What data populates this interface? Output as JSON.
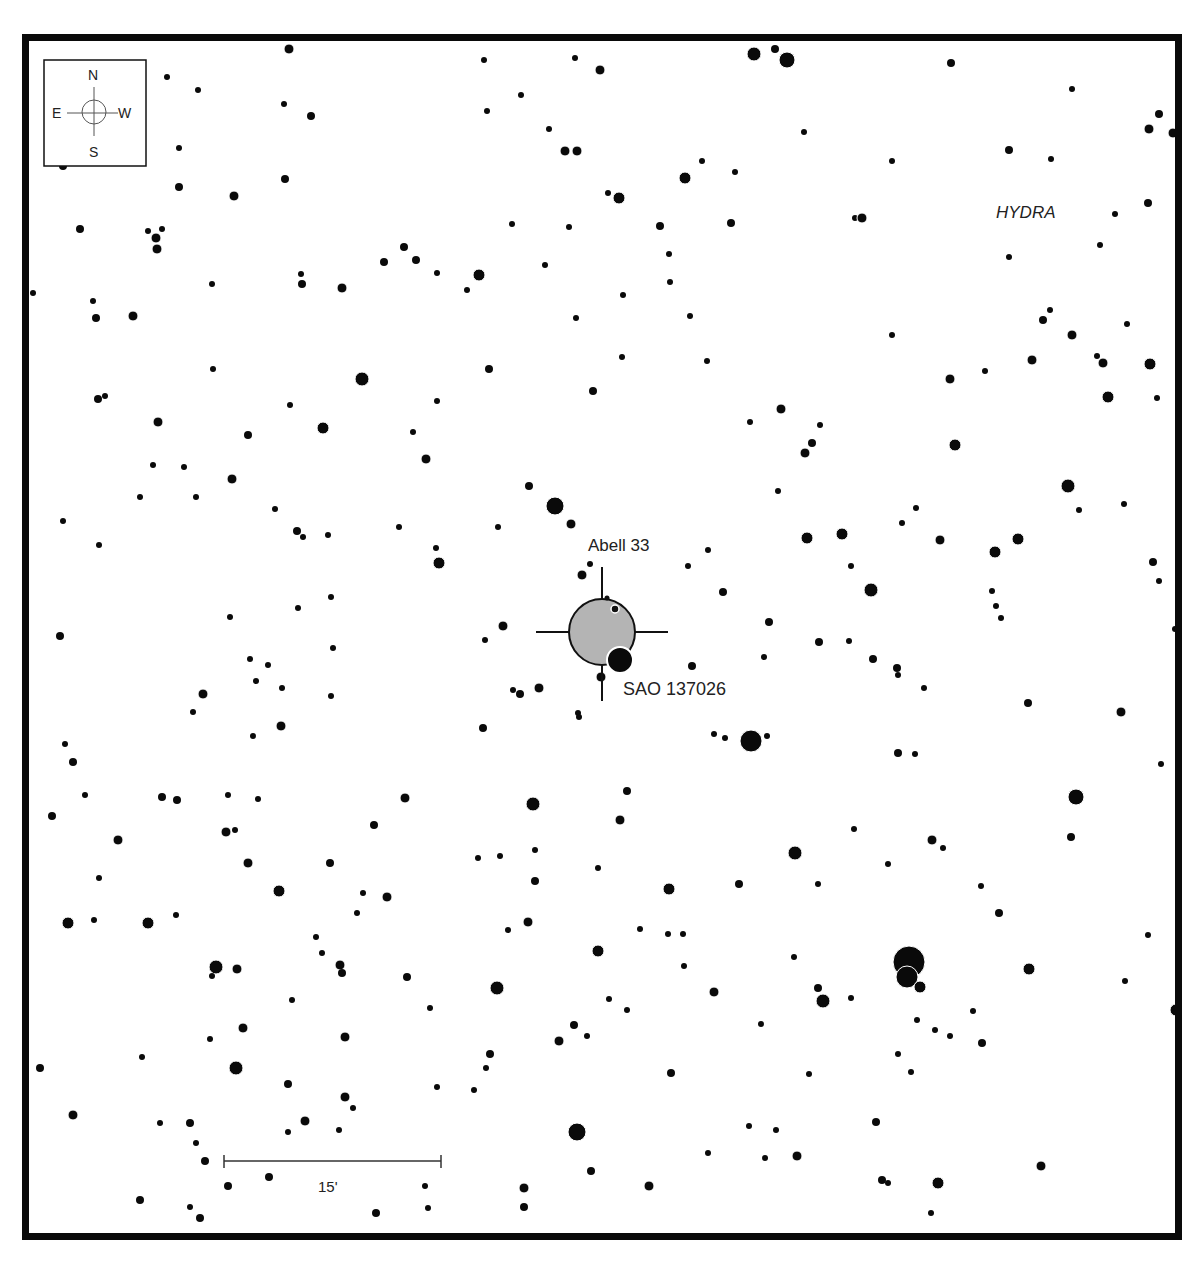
{
  "chart": {
    "constellation_label": "HYDRA",
    "target": {
      "name": "Abell 33",
      "x": 602,
      "y": 632,
      "r": 33,
      "fill": "#b4b4b4"
    },
    "nearby_star_label": {
      "name": "SAO 137026",
      "x": 620,
      "y": 660,
      "r": 13
    },
    "compass": {
      "north": "N",
      "south": "S",
      "east": "E",
      "west": "W"
    },
    "scale_bar": {
      "label": "15'",
      "x1": 224,
      "x2": 441,
      "y": 1161
    }
  },
  "stars": [
    [
      289,
      49,
      5
    ],
    [
      575,
      58,
      3
    ],
    [
      600,
      70,
      5
    ],
    [
      754,
      54,
      7
    ],
    [
      775,
      49,
      4
    ],
    [
      787,
      60,
      8
    ],
    [
      951,
      63,
      4
    ],
    [
      484,
      60,
      3
    ],
    [
      167,
      77,
      3
    ],
    [
      198,
      90,
      3
    ],
    [
      284,
      104,
      3
    ],
    [
      311,
      116,
      4
    ],
    [
      487,
      111,
      3
    ],
    [
      521,
      95,
      3
    ],
    [
      1072,
      89,
      3
    ],
    [
      1159,
      114,
      4
    ],
    [
      1149,
      129,
      5
    ],
    [
      1173,
      133,
      5
    ],
    [
      549,
      129,
      3
    ],
    [
      565,
      151,
      5
    ],
    [
      577,
      151,
      5
    ],
    [
      804,
      132,
      3
    ],
    [
      179,
      148,
      3
    ],
    [
      63,
      166,
      4
    ],
    [
      1009,
      150,
      4
    ],
    [
      1051,
      159,
      3
    ],
    [
      892,
      161,
      3
    ],
    [
      702,
      161,
      3
    ],
    [
      285,
      179,
      4
    ],
    [
      179,
      187,
      4
    ],
    [
      234,
      196,
      5
    ],
    [
      685,
      178,
      6
    ],
    [
      735,
      172,
      3
    ],
    [
      608,
      193,
      3
    ],
    [
      619,
      198,
      6
    ],
    [
      1148,
      203,
      4
    ],
    [
      80,
      229,
      4
    ],
    [
      148,
      231,
      3
    ],
    [
      156,
      238,
      5
    ],
    [
      162,
      229,
      3
    ],
    [
      157,
      249,
      5
    ],
    [
      512,
      224,
      3
    ],
    [
      569,
      227,
      3
    ],
    [
      660,
      226,
      4
    ],
    [
      731,
      223,
      4
    ],
    [
      855,
      218,
      3
    ],
    [
      862,
      218,
      5
    ],
    [
      1115,
      214,
      3
    ],
    [
      404,
      247,
      4
    ],
    [
      384,
      262,
      4
    ],
    [
      416,
      260,
      4
    ],
    [
      437,
      273,
      3
    ],
    [
      479,
      275,
      6
    ],
    [
      545,
      265,
      3
    ],
    [
      669,
      254,
      3
    ],
    [
      1100,
      245,
      3
    ],
    [
      1009,
      257,
      3
    ],
    [
      301,
      274,
      3
    ],
    [
      302,
      284,
      4
    ],
    [
      342,
      288,
      5
    ],
    [
      212,
      284,
      3
    ],
    [
      467,
      290,
      3
    ],
    [
      670,
      282,
      3
    ],
    [
      623,
      295,
      3
    ],
    [
      33,
      293,
      3
    ],
    [
      93,
      301,
      3
    ],
    [
      96,
      318,
      4
    ],
    [
      133,
      316,
      5
    ],
    [
      576,
      318,
      3
    ],
    [
      690,
      316,
      3
    ],
    [
      1050,
      310,
      3
    ],
    [
      1043,
      320,
      4
    ],
    [
      1072,
      335,
      5
    ],
    [
      1127,
      324,
      3
    ],
    [
      892,
      335,
      3
    ],
    [
      362,
      379,
      7
    ],
    [
      213,
      369,
      3
    ],
    [
      489,
      369,
      4
    ],
    [
      622,
      357,
      3
    ],
    [
      707,
      361,
      3
    ],
    [
      1032,
      360,
      5
    ],
    [
      1097,
      356,
      3
    ],
    [
      1103,
      363,
      5
    ],
    [
      1150,
      364,
      6
    ],
    [
      950,
      379,
      5
    ],
    [
      985,
      371,
      3
    ],
    [
      98,
      399,
      4
    ],
    [
      105,
      396,
      3
    ],
    [
      593,
      391,
      4
    ],
    [
      437,
      401,
      3
    ],
    [
      290,
      405,
      3
    ],
    [
      1108,
      397,
      6
    ],
    [
      1157,
      398,
      3
    ],
    [
      158,
      422,
      5
    ],
    [
      323,
      428,
      6
    ],
    [
      248,
      435,
      4
    ],
    [
      413,
      432,
      3
    ],
    [
      750,
      422,
      3
    ],
    [
      781,
      409,
      5
    ],
    [
      820,
      425,
      3
    ],
    [
      812,
      443,
      4
    ],
    [
      805,
      453,
      5
    ],
    [
      955,
      445,
      6
    ],
    [
      426,
      459,
      5
    ],
    [
      153,
      465,
      3
    ],
    [
      184,
      467,
      3
    ],
    [
      232,
      479,
      5
    ],
    [
      196,
      497,
      3
    ],
    [
      140,
      497,
      3
    ],
    [
      529,
      486,
      4
    ],
    [
      778,
      491,
      3
    ],
    [
      1068,
      486,
      7
    ],
    [
      1079,
      510,
      3
    ],
    [
      1124,
      504,
      3
    ],
    [
      555,
      506,
      9
    ],
    [
      571,
      524,
      5
    ],
    [
      275,
      509,
      3
    ],
    [
      63,
      521,
      3
    ],
    [
      297,
      531,
      4
    ],
    [
      303,
      537,
      3
    ],
    [
      399,
      527,
      3
    ],
    [
      498,
      527,
      3
    ],
    [
      328,
      535,
      3
    ],
    [
      916,
      508,
      3
    ],
    [
      902,
      523,
      3
    ],
    [
      99,
      545,
      3
    ],
    [
      436,
      548,
      3
    ],
    [
      439,
      563,
      6
    ],
    [
      807,
      538,
      6
    ],
    [
      842,
      534,
      6
    ],
    [
      940,
      540,
      5
    ],
    [
      995,
      552,
      6
    ],
    [
      1018,
      539,
      6
    ],
    [
      708,
      550,
      3
    ],
    [
      1153,
      562,
      4
    ],
    [
      1159,
      581,
      3
    ],
    [
      582,
      575,
      5
    ],
    [
      590,
      564,
      3
    ],
    [
      688,
      566,
      3
    ],
    [
      723,
      592,
      4
    ],
    [
      871,
      590,
      7
    ],
    [
      992,
      591,
      3
    ],
    [
      996,
      606,
      3
    ],
    [
      1001,
      618,
      3
    ],
    [
      298,
      608,
      3
    ],
    [
      331,
      597,
      3
    ],
    [
      230,
      617,
      3
    ],
    [
      503,
      626,
      5
    ],
    [
      769,
      622,
      4
    ],
    [
      851,
      566,
      3
    ],
    [
      1175,
      629,
      3
    ],
    [
      60,
      636,
      4
    ],
    [
      485,
      640,
      3
    ],
    [
      819,
      642,
      4
    ],
    [
      849,
      641,
      3
    ],
    [
      692,
      666,
      4
    ],
    [
      764,
      657,
      3
    ],
    [
      873,
      659,
      4
    ],
    [
      897,
      668,
      4
    ],
    [
      898,
      675,
      3
    ],
    [
      250,
      659,
      3
    ],
    [
      268,
      665,
      3
    ],
    [
      333,
      648,
      3
    ],
    [
      256,
      681,
      3
    ],
    [
      282,
      688,
      3
    ],
    [
      924,
      688,
      3
    ],
    [
      601,
      677,
      5
    ],
    [
      539,
      688,
      5
    ],
    [
      513,
      690,
      3
    ],
    [
      520,
      694,
      4
    ],
    [
      203,
      694,
      5
    ],
    [
      331,
      696,
      3
    ],
    [
      193,
      712,
      3
    ],
    [
      1028,
      703,
      4
    ],
    [
      1121,
      712,
      5
    ],
    [
      281,
      726,
      5
    ],
    [
      483,
      728,
      4
    ],
    [
      253,
      736,
      3
    ],
    [
      578,
      713,
      3
    ],
    [
      579,
      717,
      3
    ],
    [
      714,
      734,
      3
    ],
    [
      725,
      738,
      3
    ],
    [
      751,
      741,
      11
    ],
    [
      767,
      736,
      3
    ],
    [
      898,
      753,
      4
    ],
    [
      915,
      754,
      3
    ],
    [
      65,
      744,
      3
    ],
    [
      73,
      762,
      4
    ],
    [
      1161,
      764,
      3
    ],
    [
      533,
      804,
      7
    ],
    [
      627,
      791,
      4
    ],
    [
      405,
      798,
      5
    ],
    [
      1076,
      797,
      8
    ],
    [
      162,
      797,
      4
    ],
    [
      177,
      800,
      4
    ],
    [
      85,
      795,
      3
    ],
    [
      228,
      795,
      3
    ],
    [
      258,
      799,
      3
    ],
    [
      52,
      816,
      4
    ],
    [
      620,
      820,
      5
    ],
    [
      374,
      825,
      4
    ],
    [
      226,
      832,
      5
    ],
    [
      235,
      830,
      3
    ],
    [
      118,
      840,
      5
    ],
    [
      854,
      829,
      3
    ],
    [
      1071,
      837,
      4
    ],
    [
      248,
      863,
      5
    ],
    [
      330,
      863,
      4
    ],
    [
      478,
      858,
      3
    ],
    [
      500,
      856,
      3
    ],
    [
      535,
      850,
      3
    ],
    [
      795,
      853,
      7
    ],
    [
      932,
      840,
      5
    ],
    [
      943,
      848,
      3
    ],
    [
      818,
      884,
      3
    ],
    [
      888,
      864,
      3
    ],
    [
      598,
      868,
      3
    ],
    [
      535,
      881,
      4
    ],
    [
      99,
      878,
      3
    ],
    [
      739,
      884,
      4
    ],
    [
      669,
      889,
      6
    ],
    [
      279,
      891,
      6
    ],
    [
      363,
      893,
      3
    ],
    [
      387,
      897,
      5
    ],
    [
      981,
      886,
      3
    ],
    [
      68,
      923,
      6
    ],
    [
      94,
      920,
      3
    ],
    [
      148,
      923,
      6
    ],
    [
      176,
      915,
      3
    ],
    [
      357,
      913,
      3
    ],
    [
      508,
      930,
      3
    ],
    [
      528,
      922,
      5
    ],
    [
      640,
      929,
      3
    ],
    [
      668,
      934,
      3
    ],
    [
      683,
      934,
      3
    ],
    [
      999,
      913,
      4
    ],
    [
      1148,
      935,
      3
    ],
    [
      316,
      937,
      3
    ],
    [
      322,
      953,
      3
    ],
    [
      598,
      951,
      6
    ],
    [
      794,
      957,
      3
    ],
    [
      909,
      962,
      16
    ],
    [
      907,
      977,
      11
    ],
    [
      920,
      987,
      6
    ],
    [
      216,
      967,
      7
    ],
    [
      212,
      976,
      3
    ],
    [
      237,
      969,
      5
    ],
    [
      340,
      965,
      5
    ],
    [
      342,
      973,
      4
    ],
    [
      407,
      977,
      4
    ],
    [
      1029,
      969,
      6
    ],
    [
      684,
      966,
      3
    ],
    [
      1125,
      981,
      3
    ],
    [
      497,
      988,
      7
    ],
    [
      714,
      992,
      5
    ],
    [
      609,
      999,
      3
    ],
    [
      627,
      1010,
      3
    ],
    [
      818,
      988,
      4
    ],
    [
      823,
      1001,
      7
    ],
    [
      851,
      998,
      3
    ],
    [
      973,
      1011,
      3
    ],
    [
      1176,
      1010,
      6
    ],
    [
      292,
      1000,
      3
    ],
    [
      430,
      1008,
      3
    ],
    [
      243,
      1028,
      5
    ],
    [
      210,
      1039,
      3
    ],
    [
      345,
      1037,
      5
    ],
    [
      574,
      1025,
      4
    ],
    [
      559,
      1041,
      5
    ],
    [
      587,
      1036,
      3
    ],
    [
      761,
      1024,
      3
    ],
    [
      917,
      1020,
      3
    ],
    [
      935,
      1030,
      3
    ],
    [
      950,
      1036,
      3
    ],
    [
      982,
      1043,
      4
    ],
    [
      490,
      1054,
      4
    ],
    [
      486,
      1068,
      3
    ],
    [
      142,
      1057,
      3
    ],
    [
      236,
      1068,
      7
    ],
    [
      40,
      1068,
      4
    ],
    [
      898,
      1054,
      3
    ],
    [
      911,
      1072,
      3
    ],
    [
      671,
      1073,
      4
    ],
    [
      809,
      1074,
      3
    ],
    [
      288,
      1084,
      4
    ],
    [
      437,
      1087,
      3
    ],
    [
      474,
      1090,
      3
    ],
    [
      345,
      1097,
      5
    ],
    [
      353,
      1108,
      3
    ],
    [
      73,
      1115,
      5
    ],
    [
      160,
      1123,
      3
    ],
    [
      190,
      1123,
      4
    ],
    [
      305,
      1121,
      5
    ],
    [
      577,
      1132,
      9
    ],
    [
      749,
      1126,
      3
    ],
    [
      776,
      1130,
      3
    ],
    [
      876,
      1122,
      4
    ],
    [
      288,
      1132,
      3
    ],
    [
      339,
      1130,
      3
    ],
    [
      196,
      1143,
      3
    ],
    [
      205,
      1161,
      4
    ],
    [
      797,
      1156,
      5
    ],
    [
      708,
      1153,
      3
    ],
    [
      765,
      1158,
      3
    ],
    [
      1041,
      1166,
      5
    ],
    [
      591,
      1171,
      4
    ],
    [
      269,
      1177,
      4
    ],
    [
      228,
      1186,
      4
    ],
    [
      425,
      1186,
      3
    ],
    [
      524,
      1188,
      5
    ],
    [
      649,
      1186,
      5
    ],
    [
      882,
      1180,
      4
    ],
    [
      888,
      1183,
      3
    ],
    [
      938,
      1183,
      6
    ],
    [
      140,
      1200,
      4
    ],
    [
      190,
      1207,
      3
    ],
    [
      200,
      1218,
      4
    ],
    [
      376,
      1213,
      4
    ],
    [
      428,
      1208,
      3
    ],
    [
      524,
      1207,
      4
    ],
    [
      931,
      1213,
      3
    ]
  ]
}
